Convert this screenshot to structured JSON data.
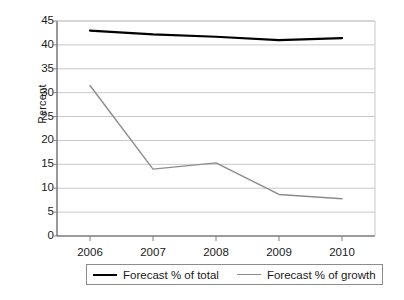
{
  "chart_data": {
    "type": "line",
    "title": "",
    "xlabel": "",
    "ylabel": "Percent",
    "categories": [
      "2006",
      "2007",
      "2008",
      "2009",
      "2010"
    ],
    "ylim": [
      0,
      45
    ],
    "ytick_step": 5,
    "yticks": [
      "0",
      "5",
      "10",
      "15",
      "20",
      "25",
      "30",
      "35",
      "40",
      "45"
    ],
    "grid": true,
    "legend_position": "bottom",
    "series": [
      {
        "name": "Forecast % of total",
        "color": "#000000",
        "values": [
          43.0,
          42.2,
          41.7,
          41.0,
          41.4
        ]
      },
      {
        "name": "Forecast % of growth",
        "color": "#8c8c8c",
        "values": [
          31.5,
          14.0,
          15.3,
          8.7,
          7.8
        ]
      }
    ]
  },
  "axes": {
    "y_title": "Percent"
  },
  "legend": {
    "entries": [
      {
        "label": "Forecast % of total"
      },
      {
        "label": "Forecast % of growth"
      }
    ]
  },
  "colors": {
    "series_total": "#000000",
    "series_growth": "#8c8c8c",
    "grid": "#c8c8c8",
    "axis": "#808080",
    "text": "#1a1a1a"
  }
}
